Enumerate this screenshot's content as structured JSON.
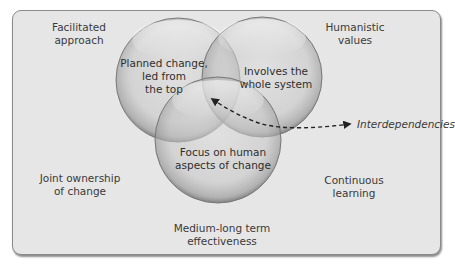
{
  "diagram": {
    "type": "venn",
    "colors": {
      "frame_bg": "#e6e6e6",
      "frame_border": "#8a8a8a",
      "circle_fill": "#c9c9c9",
      "text": "#3a3a3a"
    },
    "circles": [
      {
        "id": "top-left",
        "label": "Planned change,\nled from\nthe top"
      },
      {
        "id": "top-right",
        "label": "Involves the\nwhole system"
      },
      {
        "id": "bottom",
        "label": "Focus on human\naspects of change"
      }
    ],
    "corner_labels": {
      "top_left": "Facilitated\napproach",
      "top_right": "Humanistic\nvalues",
      "mid_left": "Joint ownership\nof change",
      "mid_right": "Continuous\nlearning",
      "bottom_center": "Medium-long term\neffectiveness"
    },
    "annotation": {
      "label": "Interdependencies",
      "style": "italic",
      "connector": "dashed double-headed arrow pointing to center overlap"
    }
  }
}
